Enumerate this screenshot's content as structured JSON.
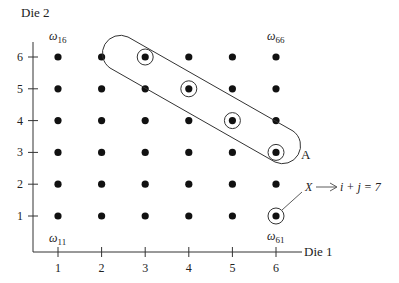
{
  "axes": {
    "y_label": "Die 2",
    "x_label": "Die 1",
    "x_ticks": [
      "1",
      "2",
      "3",
      "4",
      "5",
      "6"
    ],
    "y_ticks": [
      "1",
      "2",
      "3",
      "4",
      "5",
      "6"
    ]
  },
  "corner_labels": {
    "w16": {
      "sym": "ω",
      "sub": "16"
    },
    "w66": {
      "sym": "ω",
      "sub": "66"
    },
    "w11": {
      "sym": "ω",
      "sub": "11"
    },
    "w61": {
      "sym": "ω",
      "sub": "61"
    }
  },
  "event": {
    "name": "A",
    "points": [
      [
        3,
        6
      ],
      [
        4,
        5
      ],
      [
        5,
        4
      ],
      [
        6,
        3
      ]
    ]
  },
  "random_variable": {
    "name": "X",
    "annotation": "i + j = 7",
    "marked_point": [
      6,
      1
    ]
  },
  "grid": {
    "cols": 6,
    "rows": 6
  }
}
